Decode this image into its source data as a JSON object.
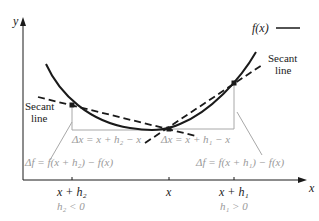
{
  "axes": {
    "y_label": "y",
    "x_label": "x"
  },
  "legend": {
    "label": "f(x)"
  },
  "secant_labels": {
    "left_line1": "Secant",
    "left_line2": "line",
    "right_line1": "Secant",
    "right_line2": "line"
  },
  "annotations": {
    "dx_left": "Δx = x + h₂ − x",
    "dx_right": "Δx = x + h₁ − x",
    "df_left": "Δf = f(x + h₂) − f(x)",
    "df_right": "Δf = f(x + h₁) − f(x)"
  },
  "ticks": {
    "left": "x + h₂",
    "center": "x",
    "right": "x + h₁"
  },
  "conditions": {
    "left": "h₂ < 0",
    "right": "h₁ > 0"
  },
  "colors": {
    "ink": "#1a1a1a",
    "gray": "#9a9a9a"
  }
}
